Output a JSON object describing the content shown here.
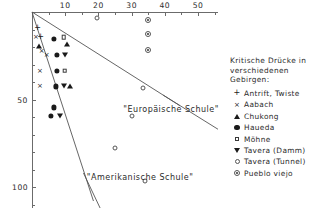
{
  "chart_data": {
    "type": "scatter",
    "title": "",
    "xlabel": "",
    "ylabel": "",
    "xlim": [
      0,
      56
    ],
    "ylim": [
      0,
      112
    ],
    "x_axis_position": "top",
    "y_axis_direction": "down",
    "grid": false,
    "legend_position": "right",
    "xticks": [
      10,
      20,
      30,
      40,
      50
    ],
    "xtick_labels": [
      "10",
      "20",
      "30",
      "40",
      "50"
    ],
    "xminor": [
      5,
      15,
      25,
      35,
      45,
      55
    ],
    "yticks": [
      50,
      100
    ],
    "ytick_labels": [
      "50",
      "100"
    ],
    "yminor": [
      10,
      20,
      30,
      40,
      60,
      70,
      80,
      90,
      110
    ],
    "annotations": [
      {
        "text": "\"Europäische Schule\"",
        "x": 27.5,
        "y": 53
      },
      {
        "text": "\"Amerikanische Schule\"",
        "x": 16.5,
        "y": 92
      }
    ],
    "reference_lines": [
      {
        "name": "Europäische Schule",
        "x0": 0,
        "y0": 0,
        "x1": 44.5,
        "y1": 53.5
      },
      {
        "name": "Europäische Schule lower",
        "x0": 39.5,
        "y0": 47.5,
        "x1": 56,
        "y1": 67
      },
      {
        "name": "Amerikanische Schule",
        "x0": 0,
        "y0": 0,
        "x1": 18.5,
        "y1": 108
      },
      {
        "name": "Amerikanische Schule lower",
        "x0": 15.5,
        "y0": 92,
        "x1": 20.5,
        "y1": 112
      }
    ],
    "series": [
      {
        "name": "Antrift, Twiste",
        "marker": "plus",
        "points": [
          [
            1.7,
            9
          ],
          [
            2.6,
            14.5
          ]
        ]
      },
      {
        "name": "Aabach",
        "marker": "cross",
        "points": [
          [
            1.2,
            14.5
          ],
          [
            2.9,
            22.5
          ],
          [
            4.4,
            24.5
          ],
          [
            2.4,
            33.5
          ],
          [
            2.4,
            42.5
          ]
        ]
      },
      {
        "name": "Chukong",
        "marker": "triangle-up",
        "points": [
          [
            2.0,
            19.5
          ],
          [
            10.5,
            18
          ],
          [
            11.5,
            42.5
          ]
        ]
      },
      {
        "name": "Haueda",
        "marker": "filled-circle",
        "points": [
          [
            6.5,
            15.5
          ],
          [
            7.5,
            24.5
          ],
          [
            7.5,
            33.5
          ],
          [
            7.3,
            42.5
          ],
          [
            6.6,
            54.5
          ],
          [
            5.7,
            59.5
          ]
        ]
      },
      {
        "name": "Möhne",
        "marker": "open-square",
        "points": [
          [
            9.6,
            14.5
          ],
          [
            9.9,
            33.5
          ]
        ]
      },
      {
        "name": "Tavera (Damm)",
        "marker": "triangle-down",
        "points": [
          [
            10.0,
            24.5
          ],
          [
            9.6,
            42.5
          ],
          [
            8.3,
            59.5
          ]
        ]
      },
      {
        "name": "Tavera (Tunnel)",
        "marker": "open-circle",
        "points": [
          [
            19.7,
            3.5
          ],
          [
            33.5,
            43.5
          ],
          [
            30.0,
            59.5
          ],
          [
            25.0,
            77.5
          ],
          [
            34.0,
            96.5
          ]
        ]
      },
      {
        "name": "Pueblo viejo",
        "marker": "dotted-circle",
        "points": [
          [
            35.0,
            4.5
          ],
          [
            35.0,
            12.5
          ],
          [
            35.0,
            21.5
          ]
        ]
      }
    ]
  },
  "legend": {
    "title": "Kritische Drücke in\nverschiedenen\nGebirgen:",
    "entries": [
      {
        "label": "Antrift, Twiste",
        "marker": "plus"
      },
      {
        "label": "Aabach",
        "marker": "cross"
      },
      {
        "label": "Chukong",
        "marker": "triangle-up"
      },
      {
        "label": "Haueda",
        "marker": "filled-circle"
      },
      {
        "label": "Möhne",
        "marker": "open-square"
      },
      {
        "label": "Tavera (Damm)",
        "marker": "triangle-down"
      },
      {
        "label": "Tavera (Tunnel)",
        "marker": "open-circle"
      },
      {
        "label": "Pueblo viejo",
        "marker": "dotted-circle"
      }
    ]
  }
}
